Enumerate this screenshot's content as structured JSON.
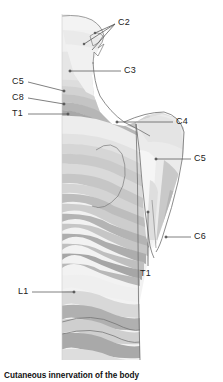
{
  "figure": {
    "caption": "Cutaneous innervation of the body",
    "alt_title": "Posterior view of head, neck, shoulder and trunk showing dermatome bands",
    "view": "posterior",
    "line_color": "#5a5a5a",
    "label_color": "#1a1a1a",
    "background": "#ffffff"
  },
  "labels": [
    {
      "id": "c2",
      "text": "C2",
      "x": 118,
      "y": 22,
      "align": "left"
    },
    {
      "id": "c3",
      "text": "C3",
      "x": 124,
      "y": 67,
      "align": "left"
    },
    {
      "id": "c5-left",
      "text": "C5",
      "x": 12,
      "y": 79,
      "align": "left"
    },
    {
      "id": "c8-left",
      "text": "C8",
      "x": 12,
      "y": 95,
      "align": "left"
    },
    {
      "id": "t1-left",
      "text": "T1",
      "x": 12,
      "y": 110,
      "align": "left"
    },
    {
      "id": "c4",
      "text": "C4",
      "x": 176,
      "y": 119,
      "align": "left"
    },
    {
      "id": "c5-right",
      "text": "C5",
      "x": 194,
      "y": 155,
      "align": "left"
    },
    {
      "id": "c6",
      "text": "C6",
      "x": 194,
      "y": 233,
      "align": "left"
    },
    {
      "id": "t1-arm",
      "text": "T1",
      "x": 140,
      "y": 270,
      "align": "left"
    },
    {
      "id": "l1",
      "text": "L1",
      "x": 18,
      "y": 288,
      "align": "left"
    }
  ],
  "dermatome_shades": {
    "lightest": "#f4f4f4",
    "light": "#e8e8e8",
    "mid_light": "#dcdcdc",
    "mid": "#cfcfcf",
    "mid_dark": "#bdbdbd",
    "dark": "#ababab",
    "darkest": "#9a9a9a"
  },
  "body_outline": {
    "left_edge_x": 62,
    "right_torso_x": 136,
    "arm_outer_x": 184,
    "top_y": 14,
    "bottom_y": 360
  }
}
